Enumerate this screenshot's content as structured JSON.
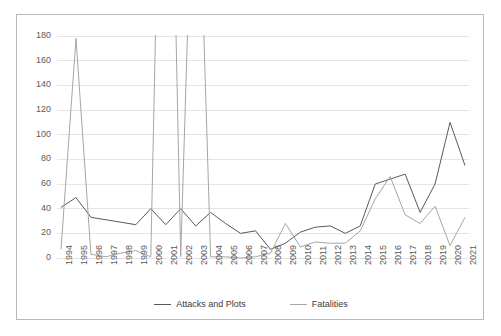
{
  "chart_data": {
    "type": "line",
    "title": "",
    "subtitle": "",
    "xlabel": "",
    "ylabel": "",
    "grid": true,
    "legend_position": "bottom",
    "ylim": [
      0,
      180
    ],
    "yticks": [
      0,
      20,
      40,
      60,
      80,
      100,
      120,
      140,
      160,
      180
    ],
    "categories": [
      "1994",
      "1995",
      "1996",
      "1997",
      "1998",
      "1999",
      "2000",
      "2001",
      "2002",
      "2003",
      "2004",
      "2005",
      "2006",
      "2007",
      "2008",
      "2009",
      "2010",
      "2011",
      "2012",
      "2013",
      "2014",
      "2015",
      "2016",
      "2017",
      "2018",
      "2019",
      "2020",
      "2021"
    ],
    "series": [
      {
        "name": "Attacks and Plots",
        "color": "#595959",
        "values": [
          41,
          49,
          33,
          31,
          29,
          27,
          40,
          27,
          40,
          26,
          37,
          28,
          20,
          22,
          7,
          12,
          21,
          25,
          26,
          20,
          26,
          60,
          64,
          68,
          37,
          60,
          110,
          75
        ]
      },
      {
        "name": "Fatalities",
        "color": "#a6a6a6",
        "values": [
          7,
          178,
          3,
          1,
          4,
          6,
          1,
          700,
          1,
          400,
          1,
          1,
          0,
          1,
          4,
          28,
          9,
          13,
          12,
          12,
          22,
          48,
          66,
          35,
          28,
          42,
          10,
          33
        ],
        "clipped_above_axis_max": [
          2001,
          2003
        ]
      }
    ]
  },
  "axis": {
    "y_tick_labels": [
      "180",
      "160",
      "140",
      "120",
      "100",
      "80",
      "60",
      "40",
      "20",
      "0"
    ],
    "x_tick_labels": [
      "1994",
      "1995",
      "1996",
      "1997",
      "1998",
      "1999",
      "2000",
      "2001",
      "2002",
      "2003",
      "2004",
      "2005",
      "2006",
      "2007",
      "2008",
      "2009",
      "2010",
      "2011",
      "2012",
      "2013",
      "2014",
      "2015",
      "2016",
      "2017",
      "2018",
      "2019",
      "2020",
      "2021"
    ]
  },
  "legend": {
    "items": [
      {
        "label": "Attacks and Plots",
        "color": "#595959"
      },
      {
        "label": "Fatalities",
        "color": "#a6a6a6"
      }
    ]
  },
  "style": {
    "border_color": "#b8b8b8",
    "gridline_color": "#e4e4e4",
    "tick_text_color": "#5a5a5a",
    "background": "#ffffff"
  }
}
